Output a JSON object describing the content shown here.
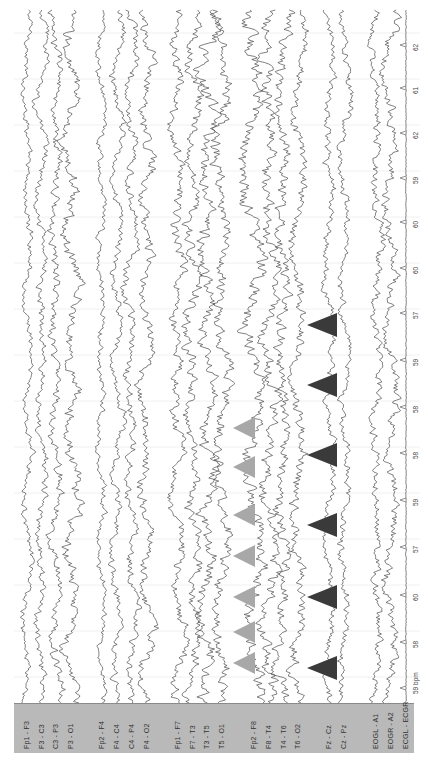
{
  "chart_data": {
    "type": "line",
    "title": "",
    "orientation": "rotated-90 (time runs top-to-bottom, channels left-to-right)",
    "channels": [
      {
        "label": "Fp1 - F3",
        "x": 27,
        "amp": 5,
        "group": 1
      },
      {
        "label": "F3 - C3",
        "x": 42,
        "amp": 6,
        "group": 1
      },
      {
        "label": "C3 - P3",
        "x": 56,
        "amp": 7,
        "group": 1
      },
      {
        "label": "P3 - O1",
        "x": 71,
        "amp": 9,
        "group": 1
      },
      {
        "label": "Fp2 - F4",
        "x": 102,
        "amp": 5,
        "group": 2
      },
      {
        "label": "F4 - C4",
        "x": 117,
        "amp": 6,
        "group": 2
      },
      {
        "label": "C4 - P4",
        "x": 132,
        "amp": 7,
        "group": 2
      },
      {
        "label": "P4 - O2",
        "x": 147,
        "amp": 8,
        "group": 2
      },
      {
        "label": "Fp1 - F7",
        "x": 178,
        "amp": 8,
        "group": 3
      },
      {
        "label": "F7 - T3",
        "x": 193,
        "amp": 9,
        "group": 3
      },
      {
        "label": "T3 - T5",
        "x": 207,
        "amp": 10,
        "group": 3
      },
      {
        "label": "T5 - O1",
        "x": 222,
        "amp": 10,
        "group": 3
      },
      {
        "label": "Fp2 - F8",
        "x": 254,
        "amp": 11,
        "group": 4
      },
      {
        "label": "F8 - T4",
        "x": 269,
        "amp": 10,
        "group": 4
      },
      {
        "label": "T4 - T6",
        "x": 284,
        "amp": 9,
        "group": 4
      },
      {
        "label": "T6 - O2",
        "x": 298,
        "amp": 8,
        "group": 4
      },
      {
        "label": "Fz - Cz",
        "x": 329,
        "amp": 6,
        "group": 5
      },
      {
        "label": "Cz - Pz",
        "x": 344,
        "amp": 6,
        "group": 5
      },
      {
        "label": "EOGL - A1",
        "x": 376,
        "amp": 7,
        "group": 6
      },
      {
        "label": "EOGR - A2",
        "x": 391,
        "amp": 8,
        "group": 6
      },
      {
        "label": "ECGL - ECGR",
        "x": 406,
        "amp": 1,
        "group": 6
      }
    ],
    "heart_rate_axis": {
      "unit": "bpm",
      "labels": [
        {
          "y": 45,
          "value": "62"
        },
        {
          "y": 88,
          "value": "61"
        },
        {
          "y": 133,
          "value": "62"
        },
        {
          "y": 178,
          "value": "59"
        },
        {
          "y": 222,
          "value": "60"
        },
        {
          "y": 268,
          "value": "60"
        },
        {
          "y": 313,
          "value": "57"
        },
        {
          "y": 360,
          "value": "59"
        },
        {
          "y": 407,
          "value": "58"
        },
        {
          "y": 453,
          "value": "58"
        },
        {
          "y": 500,
          "value": "59"
        },
        {
          "y": 547,
          "value": "57"
        },
        {
          "y": 595,
          "value": "60"
        },
        {
          "y": 642,
          "value": "58"
        },
        {
          "y": 688,
          "value": "59 bpm"
        }
      ]
    },
    "markers": {
      "gray": {
        "color": "#a8a8a8",
        "tip_x": 233,
        "base_x": 255,
        "half_h": 11,
        "y": [
          428,
          467,
          515,
          556,
          597,
          632,
          663
        ]
      },
      "dark": {
        "color": "#3a3a3a",
        "tip_x": 307,
        "base_x": 337,
        "half_h": 12,
        "y": [
          325,
          385,
          455,
          525,
          597,
          668
        ]
      }
    },
    "gridlines_y": [
      33,
      79,
      125,
      171,
      217,
      263,
      309,
      355,
      401,
      447,
      493,
      539,
      585,
      631,
      677
    ],
    "trace_range_y": [
      10,
      703
    ],
    "grid": true,
    "legend": null
  },
  "label_panel": {
    "color": "#b9b9b9"
  },
  "colors": {
    "trace": "#4a4a4a",
    "grid": "#ececec",
    "axis": "#777777"
  }
}
